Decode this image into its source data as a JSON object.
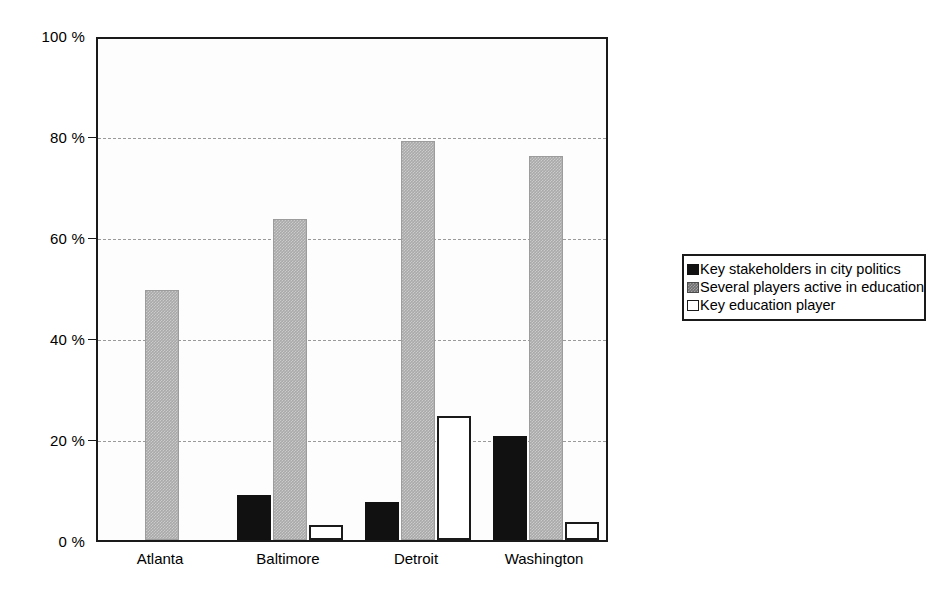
{
  "chart_data": {
    "type": "bar",
    "title": "",
    "subtitle": "",
    "xlabel": "",
    "ylabel": "",
    "categories": [
      "Atlanta",
      "Baltimore",
      "Detroit",
      "Washington"
    ],
    "series": [
      {
        "name": "Key stakeholders in city politics",
        "color": "#111111",
        "swatch": "series-black",
        "values": [
          0,
          9,
          7.5,
          20.5
        ]
      },
      {
        "name": "Several players active in education",
        "color": "#a9a9a9",
        "swatch": "series-gray",
        "values": [
          49.5,
          63.5,
          79,
          76
        ]
      },
      {
        "name": "Key education player",
        "color": "#ffffff",
        "swatch": "series-white",
        "values": [
          0,
          3,
          24.5,
          3.5
        ]
      }
    ],
    "ylim": [
      0,
      100
    ],
    "y_ticks": [
      0,
      20,
      40,
      60,
      80,
      100
    ],
    "y_tick_labels": [
      "0 %",
      "20 %",
      "40 %",
      "60 %",
      "80 %",
      "100 %"
    ],
    "grid": true,
    "grid_style": "dashed-horizontal",
    "legend_position": "right-outside",
    "value_unit": "%"
  },
  "legend": {
    "entries": [
      {
        "label": "Key stakeholders in city politics"
      },
      {
        "label": "Several players active in education"
      },
      {
        "label": "Key education player"
      }
    ]
  },
  "colors": {
    "axis": "#1a1a1a",
    "grid": "#9a9a9a",
    "background": "#ffffff",
    "plot_background": "#fdfdfd",
    "series_black": "#111111",
    "series_gray": "#a9a9a9",
    "series_white": "#ffffff"
  }
}
